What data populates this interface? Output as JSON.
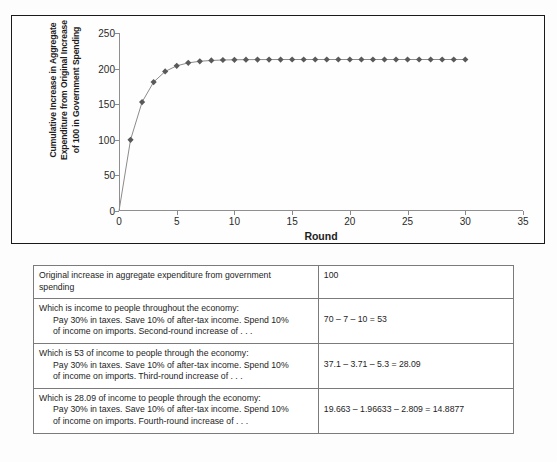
{
  "chart_data": {
    "type": "line",
    "title": "",
    "xlabel": "Round",
    "ylabel": "Cumulative Increase in Aggregate\nExpenditure from Original Increase\nof 100 in Government Spending",
    "xlim": [
      0,
      35
    ],
    "ylim": [
      0,
      250
    ],
    "xticks": [
      0,
      5,
      10,
      15,
      20,
      25,
      30,
      35
    ],
    "yticks": [
      0,
      50,
      100,
      150,
      200,
      250
    ],
    "grid": false,
    "legend": "none",
    "marker": "diamond",
    "marker_color": "#595959",
    "line_color": "#8c8c8c",
    "x": [
      1,
      2,
      3,
      4,
      5,
      6,
      7,
      8,
      9,
      10,
      11,
      12,
      13,
      14,
      15,
      16,
      17,
      18,
      19,
      20,
      21,
      22,
      23,
      24,
      25,
      26,
      27,
      28,
      29,
      30
    ],
    "values": [
      100,
      153,
      181.09,
      195.98,
      203.87,
      208.05,
      210.27,
      211.44,
      212.06,
      212.39,
      212.57,
      212.66,
      212.71,
      212.74,
      212.75,
      212.76,
      212.76,
      212.77,
      212.77,
      212.77,
      212.77,
      212.77,
      212.77,
      212.77,
      212.77,
      212.77,
      212.77,
      212.77,
      212.77,
      212.77
    ]
  },
  "chart": {
    "xlabel": "Round",
    "ylabel_line1": "Cumulative Increase in Aggregate",
    "ylabel_line2": "Expenditure from Original Increase",
    "ylabel_line3": "of 100 in Government Spending"
  },
  "table": {
    "rows": [
      {
        "desc_line1": "Original increase in aggregate expenditure from government",
        "desc_line2": "spending",
        "desc_line3": "",
        "value": "100",
        "value_align": "top"
      },
      {
        "desc_line1": "Which is income to people throughout the economy:",
        "desc_line2": "Pay 30% in taxes. Save 10% of after-tax income. Spend 10%",
        "desc_line3": "of income on imports. Second-round increase of . . .",
        "value": "70 – 7 – 10 = 53",
        "value_align": "middle"
      },
      {
        "desc_line1": "Which is 53 of income to people through the economy:",
        "desc_line2": "Pay 30% in taxes. Save 10% of after-tax income. Spend 10%",
        "desc_line3": "of income on imports. Third-round increase of . . .",
        "value": "37.1 – 3.71 – 5.3 = 28.09",
        "value_align": "middle"
      },
      {
        "desc_line1": "Which is 28.09 of income to people through the economy:",
        "desc_line2": "Pay 30% in taxes. Save 10% of after-tax income. Spend 10%",
        "desc_line3": "of income on imports. Fourth-round increase of . . .",
        "value": "19.663 – 1.96633 – 2.809 = 14.8877",
        "value_align": "middle"
      }
    ]
  }
}
